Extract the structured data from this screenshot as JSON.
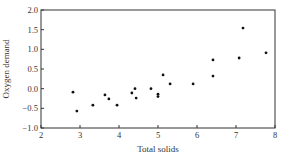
{
  "chart_data": {
    "type": "scatter",
    "title": "",
    "xlabel": "Total solids",
    "ylabel": "Oxygen demand",
    "xlim": [
      2,
      8
    ],
    "ylim": [
      -1.0,
      2.0
    ],
    "xticks": [
      2,
      3,
      4,
      5,
      6,
      7,
      8
    ],
    "yticks": [
      -1.0,
      -0.5,
      0.0,
      0.5,
      1.0,
      1.5,
      2.0
    ],
    "xtick_labels": [
      "2",
      "3",
      "4",
      "5",
      "6",
      "7",
      "8"
    ],
    "ytick_labels": [
      "−1.0",
      "−0.5",
      "0.0",
      "0.5",
      "1.0",
      "1.5",
      "2.0"
    ],
    "grid": false,
    "legend": null,
    "series": [
      {
        "name": "observations",
        "points": [
          {
            "x": 2.82,
            "y": -0.09
          },
          {
            "x": 2.92,
            "y": -0.57
          },
          {
            "x": 3.33,
            "y": -0.42
          },
          {
            "x": 3.64,
            "y": -0.16
          },
          {
            "x": 3.74,
            "y": -0.26
          },
          {
            "x": 3.95,
            "y": -0.42
          },
          {
            "x": 4.33,
            "y": -0.11
          },
          {
            "x": 4.41,
            "y": 0.0
          },
          {
            "x": 4.44,
            "y": -0.24
          },
          {
            "x": 4.82,
            "y": 0.0
          },
          {
            "x": 5.0,
            "y": -0.14
          },
          {
            "x": 5.0,
            "y": -0.2
          },
          {
            "x": 5.13,
            "y": 0.35
          },
          {
            "x": 5.31,
            "y": 0.12
          },
          {
            "x": 5.9,
            "y": 0.12
          },
          {
            "x": 6.41,
            "y": 0.32
          },
          {
            "x": 6.41,
            "y": 0.73
          },
          {
            "x": 7.08,
            "y": 0.78
          },
          {
            "x": 7.18,
            "y": 1.54
          },
          {
            "x": 7.77,
            "y": 0.91
          }
        ]
      }
    ]
  },
  "colors": {
    "axis": "#333333",
    "marker": "#111111"
  }
}
